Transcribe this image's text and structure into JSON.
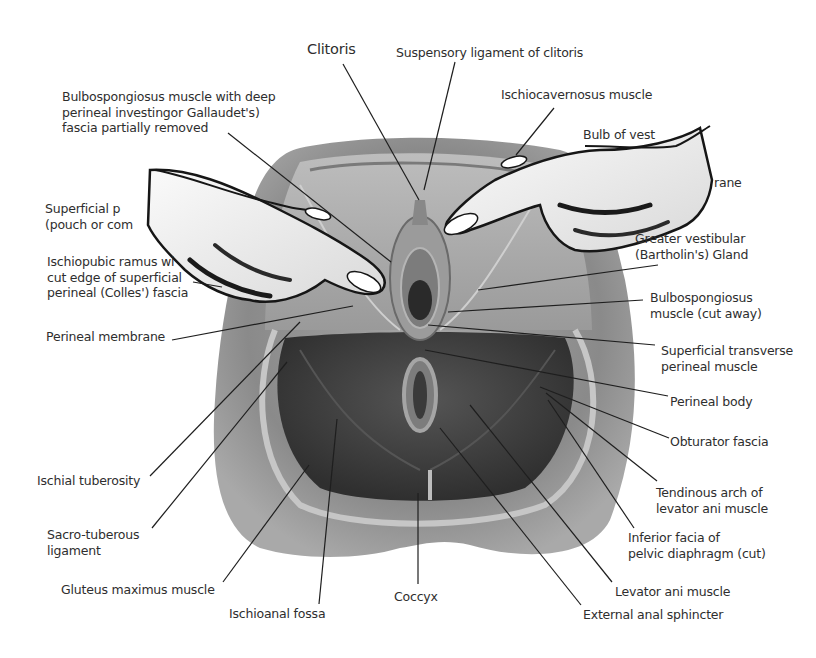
{
  "diagram": {
    "labels": [
      {
        "id": "clitoris",
        "lines": [
          "Clitoris"
        ],
        "x": 307,
        "y": 42,
        "size": "big"
      },
      {
        "id": "suspensory-ligament",
        "lines": [
          "Suspensory ligament of clitoris"
        ],
        "x": 396,
        "y": 45
      },
      {
        "id": "bulbospongiosus-deep",
        "lines": [
          "Bulbospongiosus muscle with deep",
          "perineal investingor Gallaudet's)",
          "fascia partially removed"
        ],
        "x": 62,
        "y": 89
      },
      {
        "id": "ischiocavernosus",
        "lines": [
          "Ischiocavernosus muscle"
        ],
        "x": 501,
        "y": 87
      },
      {
        "id": "bulb-of-vestibule",
        "lines": [
          "Bulb of vest"
        ],
        "x": 583,
        "y": 127
      },
      {
        "id": "perineal-membrane-right-partial",
        "lines": [
          "rane"
        ],
        "x": 714,
        "y": 175
      },
      {
        "id": "superficial-pouch",
        "lines": [
          "Superficial p",
          "(pouch or com"
        ],
        "x": 45,
        "y": 201
      },
      {
        "id": "ischiopubic-ramus",
        "lines": [
          "Ischiopubic ramus wi",
          "cut edge of superficial",
          "perineal (Colles') fascia"
        ],
        "x": 47,
        "y": 254
      },
      {
        "id": "greater-vestibular",
        "lines": [
          "Greater vestibular",
          "(Bartholin's) Gland"
        ],
        "x": 635,
        "y": 231
      },
      {
        "id": "bulbospongiosus-cut",
        "lines": [
          "Bulbospongiosus",
          "muscle (cut away)"
        ],
        "x": 650,
        "y": 290
      },
      {
        "id": "perineal-membrane",
        "lines": [
          "Perineal membrane"
        ],
        "x": 46,
        "y": 329
      },
      {
        "id": "superficial-transverse",
        "lines": [
          "Superficial transverse",
          "perineal muscle"
        ],
        "x": 661,
        "y": 343
      },
      {
        "id": "perineal-body",
        "lines": [
          "Perineal body"
        ],
        "x": 670,
        "y": 394
      },
      {
        "id": "obturator-fascia",
        "lines": [
          "Obturator fascia"
        ],
        "x": 670,
        "y": 434
      },
      {
        "id": "ischial-tuberosity",
        "lines": [
          "Ischial tuberosity"
        ],
        "x": 37,
        "y": 473
      },
      {
        "id": "tendinous-arch",
        "lines": [
          "Tendinous arch of",
          "levator ani muscle"
        ],
        "x": 656,
        "y": 485
      },
      {
        "id": "sacro-tuberous",
        "lines": [
          "Sacro-tuberous",
          "ligament"
        ],
        "x": 47,
        "y": 527
      },
      {
        "id": "inferior-facia",
        "lines": [
          "Inferior facia of",
          "pelvic diaphragm (cut)"
        ],
        "x": 628,
        "y": 530
      },
      {
        "id": "gluteus-maximus",
        "lines": [
          "Gluteus maximus muscle"
        ],
        "x": 61,
        "y": 582
      },
      {
        "id": "coccyx",
        "lines": [
          "Coccyx"
        ],
        "x": 394,
        "y": 589
      },
      {
        "id": "levator-ani",
        "lines": [
          "Levator ani muscle"
        ],
        "x": 615,
        "y": 584
      },
      {
        "id": "ischioanal-fossa",
        "lines": [
          "Ischioanal fossa"
        ],
        "x": 229,
        "y": 606
      },
      {
        "id": "external-anal-sphincter",
        "lines": [
          "External anal sphincter"
        ],
        "x": 583,
        "y": 607
      }
    ],
    "leader_lines": [
      {
        "to": "clitoris",
        "x1": 343,
        "y1": 64,
        "x2": 419,
        "y2": 200
      },
      {
        "to": "suspensory-ligament",
        "x1": 455,
        "y1": 62,
        "x2": 424,
        "y2": 190
      },
      {
        "to": "bulbospongiosus-deep",
        "x1": 228,
        "y1": 133,
        "x2": 391,
        "y2": 262
      },
      {
        "to": "ischiocavernosus",
        "x1": 554,
        "y1": 108,
        "x2": 516,
        "y2": 155
      },
      {
        "to": "ischiopubic-ramus",
        "x1": 193,
        "y1": 282,
        "x2": 222,
        "y2": 287
      },
      {
        "to": "greater-vestibular",
        "x1": 658,
        "y1": 265,
        "x2": 478,
        "y2": 290
      },
      {
        "to": "bulbospongiosus-cut",
        "x1": 643,
        "y1": 300,
        "x2": 448,
        "y2": 312
      },
      {
        "to": "perineal-membrane",
        "x1": 172,
        "y1": 340,
        "x2": 353,
        "y2": 306
      },
      {
        "to": "superficial-transverse",
        "x1": 655,
        "y1": 345,
        "x2": 428,
        "y2": 325
      },
      {
        "to": "perineal-body",
        "x1": 668,
        "y1": 396,
        "x2": 425,
        "y2": 350
      },
      {
        "to": "obturator-fascia",
        "x1": 669,
        "y1": 438,
        "x2": 540,
        "y2": 387
      },
      {
        "to": "tendinous-arch",
        "x1": 657,
        "y1": 481,
        "x2": 546,
        "y2": 393
      },
      {
        "to": "inferior-facia",
        "x1": 634,
        "y1": 528,
        "x2": 548,
        "y2": 400
      },
      {
        "to": "levator-ani",
        "x1": 612,
        "y1": 582,
        "x2": 470,
        "y2": 405
      },
      {
        "to": "external-anal-sphincter",
        "x1": 581,
        "y1": 605,
        "x2": 440,
        "y2": 428
      },
      {
        "to": "ischial-tuberosity",
        "x1": 150,
        "y1": 476,
        "x2": 300,
        "y2": 322
      },
      {
        "to": "sacro-tuberous",
        "x1": 152,
        "y1": 528,
        "x2": 287,
        "y2": 362
      },
      {
        "to": "gluteus-maximus",
        "x1": 223,
        "y1": 582,
        "x2": 309,
        "y2": 465
      },
      {
        "to": "ischioanal-fossa",
        "x1": 319,
        "y1": 604,
        "x2": 337,
        "y2": 419
      },
      {
        "to": "coccyx",
        "x1": 418,
        "y1": 584,
        "x2": 418,
        "y2": 493
      }
    ],
    "colors": {
      "background": "#ffffff",
      "label_text": "#2e2e2e",
      "leader_line": "#1e1e1e",
      "outer_tissue": "#8c8c8c",
      "deep_muscle": "#3f3f3f",
      "skin_hand": "#efefef",
      "hand_outline": "#161616"
    }
  }
}
